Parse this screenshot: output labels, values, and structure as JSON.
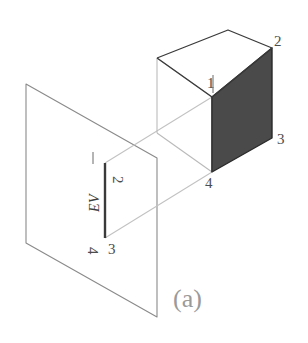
{
  "figure": {
    "caption": "(a)",
    "colors": {
      "background": "#ffffff",
      "object_outline": "#3a3a3a",
      "shaded_face": "#4a4a4a",
      "hidden_edge": "#b9b9b9",
      "projector_line": "#c2c2c2",
      "plane_outline": "#8a8a8a",
      "edge_view_line": "#3a3a3a",
      "label_text": "#4d4d4d",
      "caption_text": "#9a9a9a"
    }
  },
  "cube": {
    "name": "cube-object",
    "vertex_labels": [
      {
        "id": "cube-vertex-1",
        "text": "1",
        "x": 213,
        "y": 84
      },
      {
        "id": "cube-vertex-2",
        "text": "2",
        "x": 277,
        "y": 45
      },
      {
        "id": "cube-vertex-3",
        "text": "3",
        "x": 279,
        "y": 145
      },
      {
        "id": "cube-vertex-4",
        "text": "4",
        "x": 208,
        "y": 187
      }
    ],
    "shaded_face_label": "front-right-face"
  },
  "projection_plane": {
    "name": "projection-plane",
    "label": "transparent plane"
  },
  "edge_view": {
    "name": "edge-view-line",
    "label": "EV",
    "label_x": 98,
    "label_y": 205,
    "endpoint_labels": [
      {
        "id": "ev-vertex-1",
        "text": "1",
        "x": 92,
        "y": 158
      },
      {
        "id": "ev-vertex-2",
        "text": "2",
        "x": 115,
        "y": 172
      },
      {
        "id": "ev-vertex-4",
        "text": "4",
        "x": 92,
        "y": 243
      },
      {
        "id": "ev-vertex-3",
        "text": "3",
        "x": 113,
        "y": 250
      }
    ]
  },
  "projectors": {
    "name": "projector-lines",
    "count": 2
  }
}
